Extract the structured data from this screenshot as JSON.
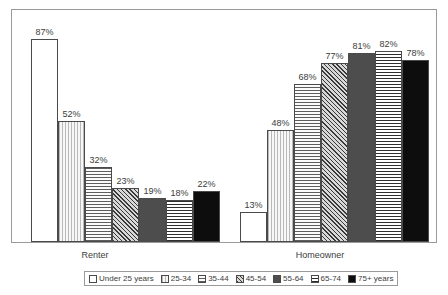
{
  "chart_data": {
    "type": "bar",
    "title": "",
    "subtitle": "",
    "xlabel": "",
    "ylabel": "",
    "categories": [
      "Renter",
      "Homeowner"
    ],
    "ylim": [
      0,
      100
    ],
    "grid": false,
    "legend_position": "bottom",
    "value_suffix": "%",
    "series": [
      {
        "name": "Under 25 years",
        "pattern": "blank",
        "values": [
          87,
          13
        ],
        "labels": [
          "87%",
          "13%"
        ]
      },
      {
        "name": "25-34",
        "pattern": "vertical",
        "values": [
          52,
          48
        ],
        "labels": [
          "52%",
          "48%"
        ]
      },
      {
        "name": "35-44",
        "pattern": "horizontal",
        "values": [
          32,
          68
        ],
        "labels": [
          "32%",
          "68%"
        ]
      },
      {
        "name": "45-54",
        "pattern": "diagonal",
        "values": [
          23,
          77
        ],
        "labels": [
          "23%",
          "77%"
        ]
      },
      {
        "name": "55-64",
        "pattern": "solid-gray",
        "values": [
          19,
          81
        ],
        "labels": [
          "19%",
          "81%"
        ]
      },
      {
        "name": "65-74",
        "pattern": "grid",
        "values": [
          18,
          82
        ],
        "labels": [
          "18%",
          "82%"
        ]
      },
      {
        "name": "75+ years",
        "pattern": "solid-black",
        "values": [
          22,
          78
        ],
        "labels": [
          "22%",
          "78%"
        ]
      }
    ]
  },
  "axis": {
    "group_labels": [
      {
        "text": "Renter"
      },
      {
        "text": "Homeowner"
      }
    ]
  },
  "legend": {
    "entries": [
      {
        "label": "Under 25 years"
      },
      {
        "label": "25-34"
      },
      {
        "label": "35-44"
      },
      {
        "label": "45-54"
      },
      {
        "label": "55-64"
      },
      {
        "label": "65-74"
      },
      {
        "label": "75+ years"
      }
    ]
  },
  "bars": {
    "renter": [
      {
        "label": "87%"
      },
      {
        "label": "52%"
      },
      {
        "label": "32%"
      },
      {
        "label": "23%"
      },
      {
        "label": "19%"
      },
      {
        "label": "18%"
      },
      {
        "label": "22%"
      }
    ],
    "homeowner": [
      {
        "label": "13%"
      },
      {
        "label": "48%"
      },
      {
        "label": "68%"
      },
      {
        "label": "77%"
      },
      {
        "label": "81%"
      },
      {
        "label": "82%"
      },
      {
        "label": "78%"
      }
    ]
  },
  "colors": {
    "frame": "#9a9a9a",
    "bar_outline": "#4a4a4a",
    "text": "#3c3c3c",
    "background": "#ffffff",
    "solid_gray": "#4d4d4d",
    "solid_black": "#0d0d0d"
  }
}
